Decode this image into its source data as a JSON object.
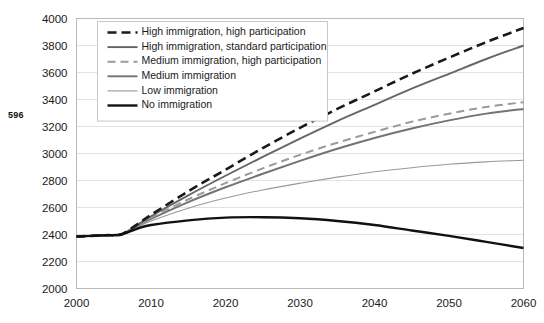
{
  "page": {
    "number": "596"
  },
  "chart_data": {
    "type": "line",
    "title": "",
    "subtitle": "",
    "xlabel": "",
    "ylabel": "",
    "xlim": [
      2000,
      2060
    ],
    "ylim": [
      2000,
      4000
    ],
    "grid": "horizontal",
    "legend_position": "top-left-inside",
    "x_ticks": [
      "2000",
      "2010",
      "2020",
      "2030",
      "2040",
      "2050",
      "2060"
    ],
    "y_ticks": [
      "2000",
      "2200",
      "2400",
      "2600",
      "2800",
      "3000",
      "3200",
      "3400",
      "3600",
      "3800",
      "4000"
    ],
    "x": [
      2000,
      2002,
      2004,
      2006,
      2008,
      2010,
      2015,
      2020,
      2025,
      2030,
      2035,
      2040,
      2045,
      2050,
      2055,
      2060
    ],
    "series": [
      {
        "name": "High immigration, high participation",
        "color": "#1a1a1a",
        "width": 2.6,
        "dash": "9,5",
        "values": [
          2385,
          2390,
          2395,
          2400,
          2470,
          2545,
          2720,
          2880,
          3040,
          3190,
          3330,
          3460,
          3590,
          3710,
          3825,
          3930
        ]
      },
      {
        "name": "High immigration, standard participation",
        "color": "#666666",
        "width": 1.9,
        "dash": "none",
        "values": [
          2385,
          2390,
          2395,
          2400,
          2465,
          2535,
          2690,
          2835,
          2975,
          3110,
          3240,
          3360,
          3480,
          3590,
          3700,
          3800
        ]
      },
      {
        "name": "Medium immigration, high participation",
        "color": "#9a9a9a",
        "width": 2.0,
        "dash": "8,5",
        "values": [
          2385,
          2390,
          2395,
          2400,
          2462,
          2525,
          2660,
          2780,
          2890,
          2990,
          3080,
          3160,
          3235,
          3295,
          3345,
          3380
        ]
      },
      {
        "name": "Medium immigration",
        "color": "#737373",
        "width": 1.9,
        "dash": "none",
        "values": [
          2385,
          2390,
          2395,
          2400,
          2458,
          2515,
          2640,
          2750,
          2850,
          2945,
          3035,
          3115,
          3185,
          3245,
          3295,
          3330
        ]
      },
      {
        "name": "Low immigration",
        "color": "#999999",
        "width": 1.1,
        "dash": "none",
        "values": [
          2385,
          2390,
          2395,
          2400,
          2450,
          2500,
          2595,
          2670,
          2730,
          2780,
          2825,
          2865,
          2895,
          2920,
          2938,
          2950
        ]
      },
      {
        "name": "No immigration",
        "color": "#111111",
        "width": 2.4,
        "dash": "none",
        "values": [
          2385,
          2390,
          2395,
          2400,
          2440,
          2470,
          2505,
          2525,
          2528,
          2520,
          2500,
          2470,
          2430,
          2390,
          2345,
          2300
        ]
      }
    ]
  }
}
